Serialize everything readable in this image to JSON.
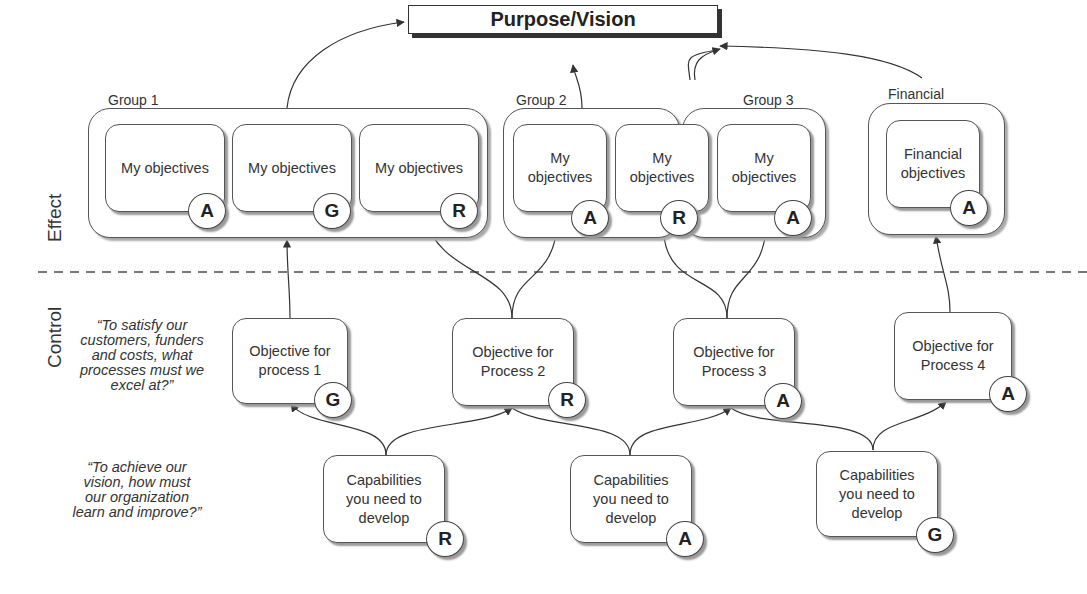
{
  "vision": {
    "title": "Purpose/Vision"
  },
  "sections": {
    "effect": "Effect",
    "control": "Control"
  },
  "questions": {
    "processes": "“To satisfy our customers, funders and costs, what processes must we excel at?”",
    "learning": "“To achieve our vision, how must our organization learn and improve?”"
  },
  "groups": [
    {
      "label": "Group 1"
    },
    {
      "label": "Group 2"
    },
    {
      "label": "Group 3"
    },
    {
      "label": "Financial"
    }
  ],
  "effect_objectives": [
    {
      "text": "My objectives",
      "rating": "A"
    },
    {
      "text": "My objectives",
      "rating": "G"
    },
    {
      "text": "My objectives",
      "rating": "R"
    },
    {
      "text": "My objectives",
      "rating": "A"
    },
    {
      "text": "My objectives",
      "rating": "R"
    },
    {
      "text": "My objectives",
      "rating": "A"
    },
    {
      "text": "Financial objectives",
      "rating": "A"
    }
  ],
  "process_objectives": [
    {
      "text": "Objective for process 1",
      "rating": "G"
    },
    {
      "text": "Objective for Process 2",
      "rating": "R"
    },
    {
      "text": "Objective for Process 3",
      "rating": "A"
    },
    {
      "text": "Objective for Process 4",
      "rating": "A"
    }
  ],
  "capabilities": [
    {
      "text": "Capabilities you need to develop",
      "rating": "R"
    },
    {
      "text": "Capabilities you need to develop",
      "rating": "A"
    },
    {
      "text": "Capabilities you need to develop",
      "rating": "G"
    }
  ],
  "colors": {
    "line": "#333333",
    "shadow": "#999999",
    "dashed": "#777777"
  }
}
